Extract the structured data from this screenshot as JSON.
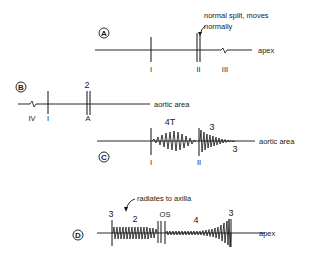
{
  "figure": {
    "panels": [
      {
        "id": "A",
        "location_label": "apex",
        "sound_labels": [
          "I",
          "II",
          "III"
        ],
        "annotation": {
          "line1": "normal split, moves",
          "line2": "normally"
        }
      },
      {
        "id": "B",
        "location_label": "aortic area",
        "sound_labels": [
          "IV",
          "I",
          "A"
        ],
        "top_label": "2"
      },
      {
        "id": "C",
        "location_label": "aortic area",
        "sound_labels": [
          "I",
          "II"
        ],
        "murmur_labels": [
          "4T",
          "3",
          "3"
        ]
      },
      {
        "id": "D",
        "location_label": "apex",
        "murmur_labels": [
          "3",
          "2",
          "OS",
          "4",
          "3"
        ],
        "annotation": {
          "line1": "radiates to axilla"
        }
      }
    ]
  }
}
